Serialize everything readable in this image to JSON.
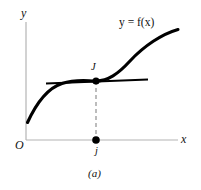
{
  "figure": {
    "caption": "(a)",
    "background_color": "#ffffff",
    "axis_color": "#b4b4b4",
    "curve_color": "#000000",
    "tangent_color": "#000000",
    "dashed_color": "#a0a0a0",
    "point_color": "#000000",
    "axes": {
      "y_label": "y",
      "x_label": "x",
      "origin_label": "O"
    },
    "curve": {
      "label": "y = f(x)",
      "shape": "cubic-inflection",
      "start": [
        27,
        122
      ],
      "end": [
        178,
        30
      ]
    },
    "points": [
      {
        "name": "inflection-point",
        "label": "J",
        "x": 96,
        "y": 81
      },
      {
        "name": "x-axis-point",
        "label": "j",
        "x": 96,
        "y": 140
      }
    ],
    "tangent_line": {
      "x_start": 46,
      "x_end": 148,
      "y": 81
    },
    "dashed_line": {
      "x": 96,
      "y_start": 81,
      "y_end": 140
    }
  }
}
